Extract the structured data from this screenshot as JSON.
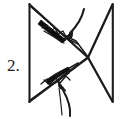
{
  "figure": {
    "step_label": "2.",
    "ink_color": "#1c1c1c",
    "fill_color": "#0d0d0d",
    "background_color": "#ffffff",
    "canvas": {
      "width": 120,
      "height": 119
    },
    "paper_outline": {
      "name": "square-sheet",
      "corners": {
        "top_left": [
          29,
          4
        ],
        "top_right": [
          113,
          4
        ],
        "bottom_right": [
          113,
          102
        ],
        "bottom_left": [
          29,
          102
        ]
      }
    },
    "crease_lines": [
      {
        "name": "diagonal-top-left-to-center",
        "from": [
          29,
          4
        ],
        "to": [
          87,
          57
        ]
      },
      {
        "name": "diagonal-top-right-to-center",
        "from": [
          113,
          4
        ],
        "to": [
          87,
          57
        ]
      },
      {
        "name": "diagonal-center-to-bottom-left",
        "from": [
          87,
          57
        ],
        "to": [
          29,
          102
        ]
      },
      {
        "name": "diagonal-center-to-bottom-right",
        "from": [
          87,
          57
        ],
        "to": [
          113,
          102
        ]
      },
      {
        "name": "upper-fold-edge",
        "from": [
          29,
          4
        ],
        "to": [
          76,
          40
        ]
      },
      {
        "name": "upper-return-edge",
        "from": [
          76,
          40
        ],
        "to": [
          87,
          57
        ]
      },
      {
        "name": "lower-fold-edge",
        "from": [
          29,
          102
        ],
        "to": [
          72,
          68
        ]
      },
      {
        "name": "lower-return-edge",
        "from": [
          72,
          68
        ],
        "to": [
          87,
          57
        ]
      }
    ],
    "shaded_band": {
      "name": "upper-dark-crimp-band",
      "description": "solid black thickened strip along the upper-left diagonal",
      "from": [
        42,
        22
      ],
      "to": [
        66,
        38
      ]
    },
    "zigzag_marks": [
      {
        "name": "upper-pleat-zigzag",
        "anchor": [
          46,
          26
        ],
        "teeth": 5
      },
      {
        "name": "lower-pleat-zigzag",
        "anchor": [
          46,
          74
        ],
        "teeth": 5
      }
    ],
    "arrows": [
      {
        "name": "top-fold-arrow",
        "direction": "down-left",
        "tail": [
          83,
          10
        ],
        "head": [
          66,
          36
        ],
        "style": "curved-solid-head"
      },
      {
        "name": "bottom-fold-arrow",
        "direction": "up",
        "tail": [
          70,
          116
        ],
        "head": [
          62,
          82
        ],
        "style": "curved-solid-head"
      }
    ]
  }
}
